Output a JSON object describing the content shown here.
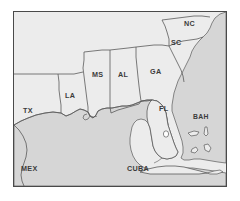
{
  "figure": {
    "frame_color": "#4a4a4a",
    "page_background": "#ffffff"
  },
  "map": {
    "land_color": "#ececec",
    "water_color": "#d4d4d4",
    "coastline_color": "#5a5a5a",
    "border_color": "#5a5a5a",
    "label_color": "#3b3b3b",
    "labels": [
      {
        "id": "tx",
        "text": "TX",
        "x": 22,
        "y": 110
      },
      {
        "id": "la",
        "text": "LA",
        "x": 57,
        "y": 95
      },
      {
        "id": "ms",
        "text": "MS",
        "x": 84,
        "y": 73
      },
      {
        "id": "al",
        "text": "AL",
        "x": 111,
        "y": 73
      },
      {
        "id": "ga",
        "text": "GA",
        "x": 143,
        "y": 70
      },
      {
        "id": "sc",
        "text": "SC",
        "x": 163,
        "y": 40
      },
      {
        "id": "nc",
        "text": "NC",
        "x": 176,
        "y": 19
      },
      {
        "id": "fl",
        "text": "FL",
        "x": 157,
        "y": 105
      },
      {
        "id": "bah",
        "text": "BAH",
        "x": 191,
        "y": 110
      },
      {
        "id": "mex",
        "text": "MEX",
        "x": 17,
        "y": 166
      },
      {
        "id": "cuba",
        "text": "CUBA",
        "x": 128,
        "y": 166
      }
    ],
    "features": [
      {
        "id": "lake-okeechobee",
        "type": "lake",
        "x": 171,
        "y": 130
      },
      {
        "id": "bahamas-islands",
        "type": "island-group",
        "count": 4
      },
      {
        "id": "cuba-island",
        "type": "island"
      },
      {
        "id": "florida-peninsula",
        "type": "peninsula"
      },
      {
        "id": "mississippi-delta",
        "type": "delta"
      }
    ],
    "states_outlined": [
      "TX",
      "LA",
      "MS",
      "AL",
      "GA",
      "FL",
      "SC",
      "NC"
    ]
  }
}
